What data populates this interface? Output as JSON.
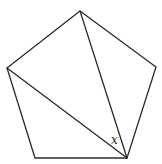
{
  "diagram": {
    "type": "geometry",
    "shape": "regular pentagon with two diagonals",
    "vertices": {
      "top": [
        80,
        11
      ],
      "left": [
        7,
        68
      ],
      "right": [
        156,
        67
      ],
      "bottom_left": [
        35,
        158
      ],
      "bottom_right": [
        127,
        158
      ]
    },
    "edges": [
      [
        "top",
        "right"
      ],
      [
        "right",
        "bottom_right"
      ],
      [
        "bottom_right",
        "bottom_left"
      ],
      [
        "bottom_left",
        "left"
      ],
      [
        "left",
        "top"
      ]
    ],
    "diagonals": [
      [
        "top",
        "bottom_right"
      ],
      [
        "left",
        "bottom_right"
      ]
    ],
    "angle_label": {
      "text": "x",
      "at_vertex": "bottom_right",
      "between": [
        "left",
        "top"
      ],
      "position": [
        111,
        144
      ]
    },
    "stroke_color": "#2b2b2b",
    "background": "#ffffff"
  }
}
